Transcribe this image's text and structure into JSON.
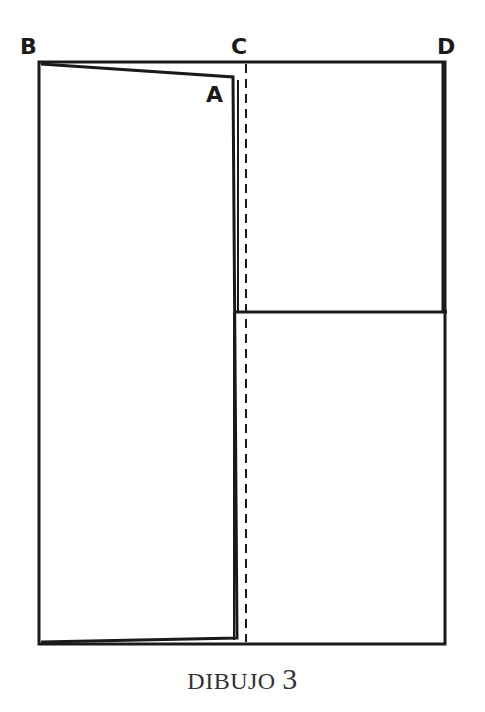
{
  "labels": {
    "B": "B",
    "C": "C",
    "D": "D",
    "A": "A"
  },
  "caption": {
    "word": "DIBUJO",
    "number": "3"
  },
  "colors": {
    "line": "#1a1a1a",
    "background": "#ffffff",
    "caption": "#333333"
  }
}
